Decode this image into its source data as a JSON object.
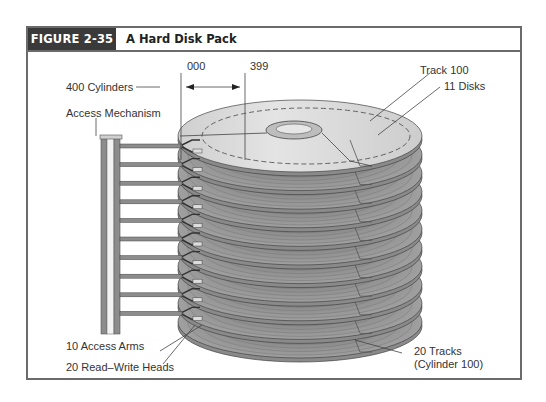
{
  "figure": {
    "number_label": "FIGURE 2-35",
    "title": "A Hard Disk Pack"
  },
  "labels": {
    "cylinders": "400 Cylinders",
    "cyl_start": "000",
    "cyl_end": "399",
    "access_mechanism": "Access Mechanism",
    "track": "Track 100",
    "disks": "11 Disks",
    "access_arms": "10 Access Arms",
    "heads": "20 Read–Write Heads",
    "tracks_line1": "20 Tracks",
    "tracks_line2": "(Cylinder 100)"
  },
  "diagram": {
    "disk_count": 11,
    "arm_count": 10,
    "colors": {
      "frame": "#6b6b6b",
      "header_bg": "#3a3a3a",
      "platter_top": "#d9d9d9",
      "platter_side": "#8a8a8a",
      "platter_dark": "#7a7a7a",
      "arm": "#8c8c8c",
      "leader": "#444444"
    }
  }
}
